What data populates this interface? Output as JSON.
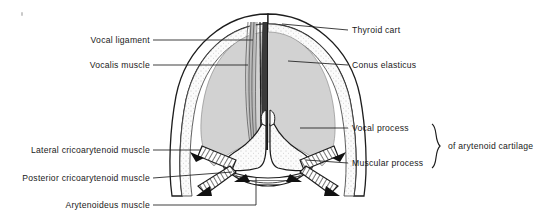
{
  "figure": {
    "background_color": "#ffffff",
    "ink_color": "#1a1a1a",
    "fill_grey": "#d0d0d0",
    "cartilage_fill": "#fbfbfb"
  },
  "labels_left": [
    {
      "id": "vocal-ligament",
      "text": "Vocal ligament",
      "text_x": 150,
      "text_y": 40,
      "line_x1": 153,
      "line_y1": 40,
      "line_x2": 253,
      "line_y2": 40
    },
    {
      "id": "vocalis-muscle",
      "text": "Vocalis muscle",
      "text_x": 150,
      "text_y": 65,
      "line_x1": 153,
      "line_y1": 65,
      "line_x2": 248,
      "line_y2": 65
    },
    {
      "id": "lateral-cricoarytenoid-muscle",
      "text": "Lateral cricoarytenoid muscle",
      "text_x": 150,
      "text_y": 150,
      "line_x1": 153,
      "line_y1": 150,
      "line_x2": 200,
      "line_y2": 150
    },
    {
      "id": "posterior-cricoarytenoid-muscle",
      "text": "Posterior cricoarytenoid muscle",
      "text_x": 150,
      "text_y": 178,
      "line_x1": 153,
      "line_y1": 178,
      "line_x2": 232,
      "line_y2": 172
    },
    {
      "id": "arytenoideus-muscle",
      "text": "Arytenoideus muscle",
      "text_x": 150,
      "text_y": 205,
      "line_x1": 153,
      "line_y1": 205,
      "line_x2": 256,
      "line_y2": 205
    }
  ],
  "labels_right": [
    {
      "id": "thyroid-cartilage",
      "text": "Thyroid cart",
      "text_x": 352,
      "text_y": 30,
      "line_x1": 282,
      "line_y1": 24,
      "line_x2": 348,
      "line_y2": 30
    },
    {
      "id": "conus-elasticus",
      "text": "Conus elasticus",
      "text_x": 352,
      "text_y": 65,
      "line_x1": 288,
      "line_y1": 61,
      "line_x2": 348,
      "line_y2": 65
    },
    {
      "id": "vocal-process",
      "text": "Vocal process",
      "text_x": 352,
      "text_y": 128,
      "line_x1": 300,
      "line_y1": 128,
      "line_x2": 348,
      "line_y2": 128
    },
    {
      "id": "muscular-process",
      "text": "Muscular process",
      "text_x": 352,
      "text_y": 163,
      "line_x1": 306,
      "line_y1": 160,
      "line_x2": 348,
      "line_y2": 163
    }
  ],
  "brace": {
    "id": "arytenoid-cartilage-brace",
    "text": "of arytenoid cartilage",
    "text_x": 448,
    "text_y": 146,
    "top_y": 124,
    "bottom_y": 168,
    "x": 437
  },
  "artifact": {
    "id": "scan-speck",
    "x": 21,
    "y": 12
  }
}
